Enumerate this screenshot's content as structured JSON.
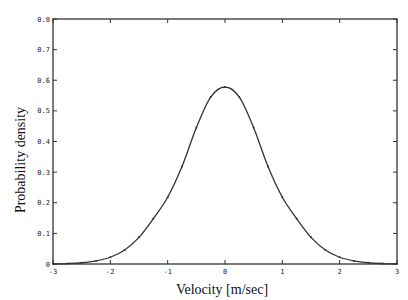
{
  "chart_data": {
    "type": "line",
    "title": "",
    "xlabel": "Velocity [m/sec]",
    "ylabel": "Probability density",
    "xlim": [
      -3,
      3
    ],
    "ylim": [
      0,
      0.8
    ],
    "xticks": [
      "-3",
      "-2",
      "-1",
      "0",
      "1",
      "2",
      "3"
    ],
    "yticks": [
      "0",
      "0.1",
      "0.2",
      "0.3",
      "0.4",
      "0.5",
      "0.6",
      "0.7",
      "0.8"
    ],
    "grid": false,
    "legend": null,
    "series": [
      {
        "name": "density curve",
        "style": "solid line with small dot markers",
        "x": [
          -3.0,
          -2.75,
          -2.5,
          -2.25,
          -2.0,
          -1.75,
          -1.5,
          -1.25,
          -1.0,
          -0.75,
          -0.5,
          -0.25,
          0.0,
          0.25,
          0.5,
          0.75,
          1.0,
          1.25,
          1.5,
          1.75,
          2.0,
          2.25,
          2.5,
          2.75,
          3.0
        ],
        "y": [
          0.0005,
          0.0015,
          0.004,
          0.01,
          0.022,
          0.046,
          0.087,
          0.148,
          0.218,
          0.318,
          0.445,
          0.545,
          0.578,
          0.545,
          0.445,
          0.318,
          0.218,
          0.148,
          0.087,
          0.046,
          0.022,
          0.01,
          0.004,
          0.0015,
          0.0005
        ]
      }
    ]
  }
}
